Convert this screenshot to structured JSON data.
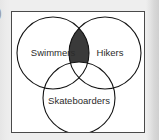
{
  "figure": {
    "type": "venn-diagram",
    "set_count": 3,
    "border_color": "#4a4a4a",
    "background_color": "#ffffff",
    "outer_background_color": "#e9e9e9",
    "circle_stroke_color": "#141414",
    "shaded_fill_color": "#3a3a3a",
    "label_color": "#2b2b2b"
  },
  "marker": {
    "glyph": ")"
  },
  "sets": [
    {
      "id": "swimmers",
      "label": "Swimmers",
      "cx": 41,
      "cy": 41,
      "r": 36,
      "label_x": 41,
      "label_y": 44
    },
    {
      "id": "hikers",
      "label": "Hikers",
      "cx": 93,
      "cy": 41,
      "r": 36,
      "label_x": 98,
      "label_y": 44
    },
    {
      "id": "skateboarders",
      "label": "Skateboarders",
      "cx": 67,
      "cy": 86,
      "r": 36,
      "label_x": 67,
      "label_y": 92
    }
  ],
  "shaded_regions": [
    {
      "id": "swimmers-and-hikers-only",
      "description": "Swimmers AND Hikers, NOT Skateboarders",
      "includes": [
        "swimmers",
        "hikers"
      ],
      "excludes": [
        "skateboarders"
      ],
      "fill": "#3a3a3a"
    }
  ]
}
